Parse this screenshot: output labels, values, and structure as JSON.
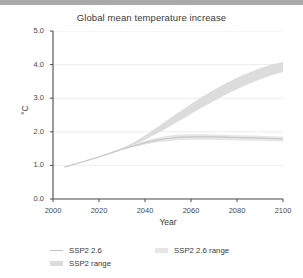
{
  "window": {
    "top_strip_color": "#a9a9a9"
  },
  "chart_data": {
    "type": "line",
    "title": "Global mean temperature increase",
    "xlabel": "Year",
    "ylabel": "°C",
    "xlim": [
      2000,
      2100
    ],
    "ylim": [
      0.0,
      5.0
    ],
    "xticks": [
      "2000",
      "2020",
      "2040",
      "2060",
      "2080",
      "2100"
    ],
    "yticks": [
      "0.0",
      "1.0",
      "2.0",
      "3.0",
      "4.0",
      "5.0"
    ],
    "grid": "horizontal",
    "legend_position": "bottom-left",
    "colors": {
      "ssp26_line": "#c7c7c7",
      "ssp26_range": "#e6e6e6",
      "ssp2_range": "#dcdcdc",
      "gridline": "#ededed",
      "axis": "#4a4a4a"
    },
    "x": [
      2005,
      2010,
      2015,
      2020,
      2025,
      2030,
      2035,
      2040,
      2045,
      2050,
      2055,
      2060,
      2065,
      2070,
      2075,
      2080,
      2085,
      2090,
      2095,
      2100
    ],
    "series": [
      {
        "name": "SSP2 2.6",
        "type": "line",
        "values": [
          0.95,
          1.05,
          1.15,
          1.25,
          1.36,
          1.48,
          1.58,
          1.67,
          1.75,
          1.8,
          1.84,
          1.85,
          1.85,
          1.85,
          1.84,
          1.83,
          1.82,
          1.81,
          1.8,
          1.79
        ]
      },
      {
        "name": "SSP2 2.6 range",
        "type": "band",
        "lower": [
          0.95,
          1.05,
          1.15,
          1.25,
          1.35,
          1.46,
          1.55,
          1.62,
          1.68,
          1.72,
          1.75,
          1.76,
          1.76,
          1.76,
          1.75,
          1.74,
          1.73,
          1.73,
          1.72,
          1.71
        ],
        "upper": [
          0.95,
          1.05,
          1.16,
          1.26,
          1.38,
          1.5,
          1.62,
          1.73,
          1.82,
          1.88,
          1.92,
          1.93,
          1.93,
          1.92,
          1.91,
          1.9,
          1.89,
          1.88,
          1.87,
          1.86
        ]
      },
      {
        "name": "SSP2 range",
        "type": "band",
        "lower": [
          0.95,
          1.05,
          1.15,
          1.25,
          1.36,
          1.48,
          1.6,
          1.76,
          1.94,
          2.13,
          2.33,
          2.53,
          2.73,
          2.92,
          3.1,
          3.27,
          3.42,
          3.56,
          3.68,
          3.78
        ],
        "upper": [
          0.95,
          1.05,
          1.16,
          1.27,
          1.39,
          1.52,
          1.68,
          1.89,
          2.12,
          2.36,
          2.6,
          2.83,
          3.05,
          3.25,
          3.44,
          3.61,
          3.76,
          3.89,
          4.0,
          4.08
        ]
      }
    ],
    "legend": [
      {
        "label": "SSP2 2.6",
        "swatch": "line",
        "color": "#c7c7c7"
      },
      {
        "label": "SSP2 2.6 range",
        "swatch": "band-light",
        "color": "#e6e6e6"
      },
      {
        "label": "SSP2 range",
        "swatch": "band",
        "color": "#dcdcdc"
      }
    ]
  }
}
